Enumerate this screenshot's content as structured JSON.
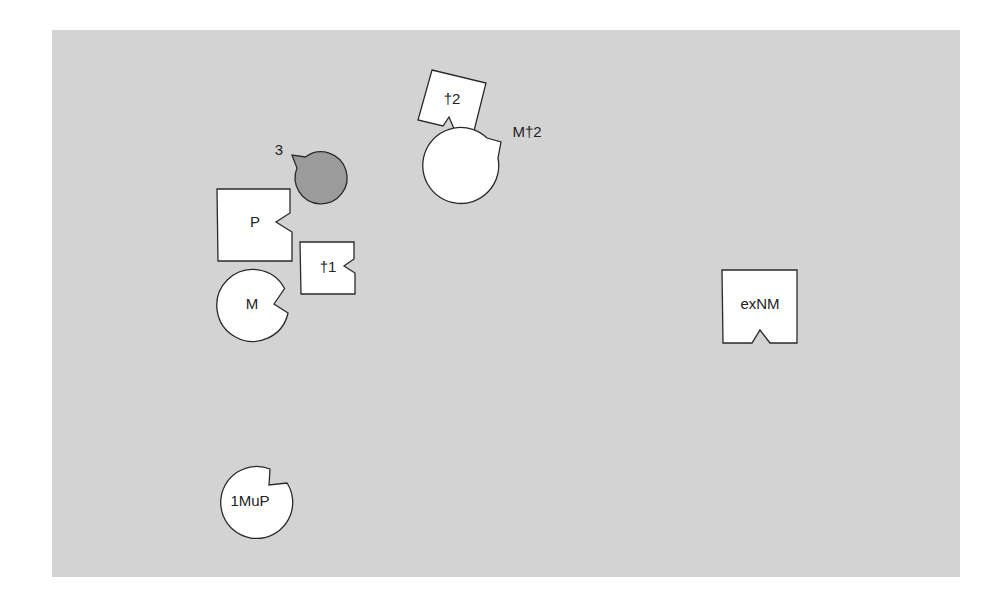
{
  "diagram": {
    "background": {
      "panel_color": "#d3d3d3",
      "page_color": "#ffffff"
    },
    "shapes": [
      {
        "id": "3",
        "label": "3",
        "kind": "notched-circle",
        "fill": "#9b9b9b"
      },
      {
        "id": "P",
        "label": "P",
        "kind": "notched-square",
        "fill": "#ffffff"
      },
      {
        "id": "t1",
        "label": "†1",
        "kind": "notched-square",
        "fill": "#ffffff"
      },
      {
        "id": "M",
        "label": "M",
        "kind": "notched-circle",
        "fill": "#ffffff"
      },
      {
        "id": "t2",
        "label": "†2",
        "kind": "notched-square-rotated",
        "fill": "#ffffff"
      },
      {
        "id": "Mt2",
        "label": "M†2",
        "kind": "notched-circle",
        "fill": "#ffffff"
      },
      {
        "id": "exNM",
        "label": "exNM",
        "kind": "notched-square",
        "fill": "#ffffff"
      },
      {
        "id": "1MuP",
        "label": "1MuP",
        "kind": "notched-circle",
        "fill": "#ffffff"
      }
    ]
  }
}
